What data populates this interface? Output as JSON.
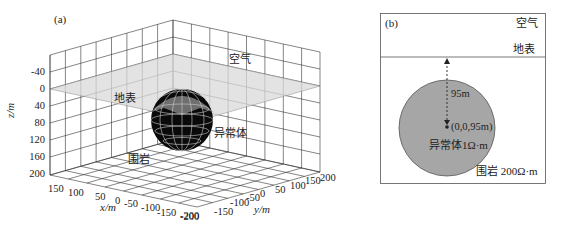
{
  "panel_a": {
    "label": "(a)",
    "z_axis": {
      "label": "z/m",
      "ticks": [
        "-40",
        "0",
        "40",
        "80",
        "120",
        "160",
        "200"
      ]
    },
    "x_axis": {
      "label": "x/m",
      "ticks": [
        "150",
        "100",
        "50",
        "0",
        "-50",
        "-100",
        "-150",
        "-200"
      ]
    },
    "y_axis": {
      "label": "y/m",
      "ticks": [
        "-200",
        "-150",
        "-100",
        "-50",
        "0",
        "50",
        "100",
        "150",
        "200"
      ]
    },
    "annotations": {
      "air": "空气",
      "surface": "地表",
      "anomaly": "异常体",
      "host_rock": "围岩"
    },
    "colors": {
      "grid": "#333333",
      "surface_plane": "#d9d9d9",
      "sphere_body": "#0a0a0a",
      "sphere_top": "#6e6e6e",
      "sphere_mesh": "#cfcfcf"
    }
  },
  "panel_b": {
    "label": "(b)",
    "air": "空气",
    "surface": "地表",
    "depth_label": "95m",
    "center_label": "(0,0,95m)",
    "anomaly_label": "异常体1Ω·m",
    "host_rock_label": "围岩 200Ω·m",
    "colors": {
      "circle_fill": "#a6a6a6",
      "border": "#555555"
    }
  }
}
